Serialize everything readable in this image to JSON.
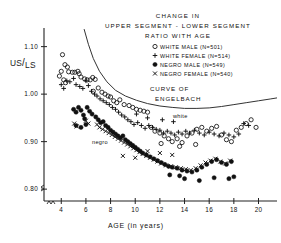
{
  "chart_data": {
    "type": "scatter",
    "title": "CHANGE IN UPPER SEGMENT - LOWER SEGMENT RATIO WITH AGE",
    "title_lines": [
      "CHANGE IN",
      "UPPER SEGMENT - LOWER SEGMENT",
      "RATIO WITH AGE"
    ],
    "xlabel": "AGE (in years)",
    "ylabel": "US/LS",
    "ylabel_parts": {
      "numerator": "US",
      "slash": "/",
      "denominator": "LS"
    },
    "xlim": [
      2.6,
      21.5
    ],
    "ylim": [
      0.775,
      1.135
    ],
    "xticks": [
      4,
      6,
      8,
      10,
      12,
      14,
      16,
      18,
      20
    ],
    "xtick_labels": [
      "4",
      "6",
      "8",
      "10",
      "12",
      "14",
      "16",
      "18",
      "20"
    ],
    "yticks": [
      0.8,
      0.9,
      1.0,
      1.1
    ],
    "ytick_labels": [
      "0.80",
      "0.90",
      "1.00",
      "1.10"
    ],
    "grid": false,
    "axis_break_x": true,
    "axis_break_y": true,
    "legend_position": "upper right",
    "legend": [
      {
        "symbol": "open-circle",
        "label": "WHITE MALE (N=501)",
        "series": "white_male",
        "n": 501
      },
      {
        "symbol": "plus",
        "label": "WHITE FEMALE (N=514)",
        "series": "white_female",
        "n": 514
      },
      {
        "symbol": "filled-circle",
        "label": "NEGRO MALE (N=549)",
        "series": "negro_male",
        "n": 549
      },
      {
        "symbol": "x-cross",
        "label": "NEGRO FEMALE (N=540)",
        "series": "negro_female",
        "n": 540
      }
    ],
    "annotations": [
      {
        "text": "CURVE OF",
        "x": 11.2,
        "y": 0.992
      },
      {
        "text": "ENGELBACH",
        "x": 11.6,
        "y": 0.972
      },
      {
        "text": "white",
        "x": 12.9,
        "y": 0.942
      },
      {
        "text": "negro",
        "x": 8.1,
        "y": 0.888
      }
    ],
    "curve": {
      "name": "Curve of Engelbach",
      "points": [
        [
          5.85,
          1.137
        ],
        [
          6.2,
          1.105
        ],
        [
          6.6,
          1.075
        ],
        [
          7.1,
          1.048
        ],
        [
          7.7,
          1.026
        ],
        [
          8.4,
          1.008
        ],
        [
          9.2,
          0.996
        ],
        [
          10.1,
          0.987
        ],
        [
          11.0,
          0.98
        ],
        [
          12.0,
          0.975
        ],
        [
          13.0,
          0.972
        ],
        [
          14.0,
          0.97
        ],
        [
          15.0,
          0.97
        ],
        [
          16.0,
          0.971
        ],
        [
          17.0,
          0.974
        ],
        [
          18.0,
          0.978
        ],
        [
          19.0,
          0.982
        ],
        [
          20.0,
          0.986
        ],
        [
          21.0,
          0.99
        ],
        [
          21.5,
          0.992
        ]
      ]
    },
    "series": [
      {
        "name": "WHITE MALE",
        "symbol": "open-circle",
        "points": [
          [
            4.1,
            1.083
          ],
          [
            4.3,
            1.062
          ],
          [
            4.5,
            1.057
          ],
          [
            4.0,
            1.048
          ],
          [
            3.85,
            1.038
          ],
          [
            4.6,
            1.047
          ],
          [
            4.9,
            1.046
          ],
          [
            5.1,
            1.046
          ],
          [
            5.35,
            1.048
          ],
          [
            5.45,
            1.043
          ],
          [
            4.2,
            1.03
          ],
          [
            4.35,
            1.024
          ],
          [
            5.6,
            1.036
          ],
          [
            5.9,
            1.032
          ],
          [
            6.1,
            1.03
          ],
          [
            6.35,
            1.03
          ],
          [
            6.55,
            1.035
          ],
          [
            6.75,
            1.031
          ],
          [
            7.0,
            1.013
          ],
          [
            6.6,
            1.006
          ],
          [
            7.3,
            1.004
          ],
          [
            7.55,
            1.0
          ],
          [
            7.8,
            0.996
          ],
          [
            8.0,
            0.994
          ],
          [
            8.25,
            0.986
          ],
          [
            8.5,
            0.982
          ],
          [
            8.75,
            0.988
          ],
          [
            9.1,
            0.978
          ],
          [
            9.5,
            0.976
          ],
          [
            9.8,
            0.972
          ],
          [
            10.1,
            0.968
          ],
          [
            10.4,
            0.966
          ],
          [
            10.7,
            0.964
          ],
          [
            11.0,
            0.962
          ],
          [
            11.3,
            0.93
          ],
          [
            11.6,
            0.922
          ],
          [
            12.0,
            0.918
          ],
          [
            12.35,
            0.912
          ],
          [
            12.7,
            0.906
          ],
          [
            13.0,
            0.9
          ],
          [
            13.4,
            0.906
          ],
          [
            13.8,
            0.898
          ],
          [
            14.2,
            0.912
          ],
          [
            14.6,
            0.918
          ],
          [
            15.0,
            0.926
          ],
          [
            15.4,
            0.93
          ],
          [
            15.8,
            0.922
          ],
          [
            16.2,
            0.928
          ],
          [
            16.6,
            0.932
          ],
          [
            17.0,
            0.914
          ],
          [
            17.4,
            0.904
          ],
          [
            17.8,
            0.9
          ],
          [
            18.2,
            0.924
          ],
          [
            18.6,
            0.93
          ],
          [
            19.0,
            0.938
          ],
          [
            19.4,
            0.946
          ],
          [
            19.8,
            0.93
          ],
          [
            12.1,
            0.896
          ],
          [
            13.6,
            0.89
          ],
          [
            14.9,
            0.894
          ]
        ]
      },
      {
        "name": "WHITE FEMALE",
        "symbol": "plus",
        "points": [
          [
            4.0,
            1.02
          ],
          [
            4.2,
            1.012
          ],
          [
            4.45,
            1.028
          ],
          [
            4.7,
            1.026
          ],
          [
            5.0,
            1.033
          ],
          [
            5.2,
            1.02
          ],
          [
            5.5,
            1.016
          ],
          [
            5.75,
            1.012
          ],
          [
            6.0,
            1.028
          ],
          [
            6.2,
            1.018
          ],
          [
            6.45,
            1.006
          ],
          [
            6.7,
            1.0
          ],
          [
            6.9,
            0.996
          ],
          [
            7.15,
            0.99
          ],
          [
            7.4,
            0.986
          ],
          [
            7.65,
            0.982
          ],
          [
            7.9,
            0.978
          ],
          [
            8.15,
            0.972
          ],
          [
            8.4,
            0.968
          ],
          [
            8.65,
            0.962
          ],
          [
            8.9,
            0.956
          ],
          [
            9.15,
            0.952
          ],
          [
            9.4,
            0.946
          ],
          [
            9.65,
            0.942
          ],
          [
            9.9,
            0.936
          ],
          [
            10.2,
            0.94
          ],
          [
            10.5,
            0.934
          ],
          [
            10.8,
            0.928
          ],
          [
            11.1,
            0.934
          ],
          [
            11.4,
            0.93
          ],
          [
            11.7,
            0.926
          ],
          [
            12.0,
            0.924
          ],
          [
            12.3,
            0.918
          ],
          [
            12.6,
            0.922
          ],
          [
            12.9,
            0.918
          ],
          [
            13.2,
            0.914
          ],
          [
            13.5,
            0.92
          ],
          [
            13.8,
            0.916
          ],
          [
            14.1,
            0.922
          ],
          [
            14.4,
            0.918
          ],
          [
            14.8,
            0.924
          ],
          [
            15.2,
            0.918
          ],
          [
            15.6,
            0.914
          ],
          [
            16.0,
            0.92
          ],
          [
            16.4,
            0.916
          ],
          [
            16.8,
            0.912
          ],
          [
            17.2,
            0.918
          ],
          [
            17.6,
            0.914
          ],
          [
            18.0,
            0.91
          ],
          [
            18.4,
            0.916
          ],
          [
            18.8,
            0.938
          ],
          [
            19.2,
            0.934
          ],
          [
            10.1,
            0.958
          ],
          [
            11.0,
            0.95
          ],
          [
            12.2,
            0.946
          ],
          [
            13.1,
            0.942
          ]
        ]
      },
      {
        "name": "NEGRO MALE",
        "symbol": "filled-circle",
        "points": [
          [
            5.0,
            0.968
          ],
          [
            5.2,
            0.962
          ],
          [
            5.4,
            0.972
          ],
          [
            5.6,
            0.966
          ],
          [
            5.8,
            0.956
          ],
          [
            5.9,
            0.948
          ],
          [
            6.1,
            0.972
          ],
          [
            6.3,
            0.964
          ],
          [
            6.5,
            0.958
          ],
          [
            6.0,
            0.936
          ],
          [
            5.2,
            0.934
          ],
          [
            5.6,
            0.93
          ],
          [
            6.8,
            0.952
          ],
          [
            7.0,
            0.946
          ],
          [
            7.2,
            0.94
          ],
          [
            7.4,
            0.942
          ],
          [
            7.6,
            0.934
          ],
          [
            7.8,
            0.93
          ],
          [
            8.0,
            0.924
          ],
          [
            8.2,
            0.92
          ],
          [
            8.4,
            0.916
          ],
          [
            8.6,
            0.912
          ],
          [
            8.8,
            0.908
          ],
          [
            9.0,
            0.912
          ],
          [
            9.2,
            0.904
          ],
          [
            9.4,
            0.9
          ],
          [
            9.6,
            0.896
          ],
          [
            9.8,
            0.892
          ],
          [
            10.0,
            0.888
          ],
          [
            10.2,
            0.884
          ],
          [
            10.4,
            0.88
          ],
          [
            10.6,
            0.876
          ],
          [
            10.9,
            0.872
          ],
          [
            11.2,
            0.868
          ],
          [
            11.5,
            0.864
          ],
          [
            11.8,
            0.86
          ],
          [
            12.1,
            0.856
          ],
          [
            12.4,
            0.852
          ],
          [
            12.7,
            0.848
          ],
          [
            13.0,
            0.846
          ],
          [
            13.4,
            0.844
          ],
          [
            13.8,
            0.84
          ],
          [
            14.2,
            0.838
          ],
          [
            14.6,
            0.836
          ],
          [
            15.0,
            0.84
          ],
          [
            15.4,
            0.846
          ],
          [
            15.8,
            0.852
          ],
          [
            16.2,
            0.858
          ],
          [
            16.6,
            0.862
          ],
          [
            17.0,
            0.856
          ],
          [
            17.4,
            0.852
          ],
          [
            17.8,
            0.858
          ],
          [
            14.0,
            0.822
          ],
          [
            15.2,
            0.818
          ],
          [
            16.4,
            0.824
          ],
          [
            17.6,
            0.822
          ],
          [
            12.8,
            0.83
          ],
          [
            13.6,
            0.828
          ],
          [
            18.0,
            0.826
          ]
        ]
      },
      {
        "name": "NEGRO FEMALE",
        "symbol": "x-cross",
        "points": [
          [
            5.05,
            0.938
          ],
          [
            5.25,
            0.932
          ],
          [
            6.0,
            0.944
          ],
          [
            6.2,
            0.938
          ],
          [
            6.9,
            0.936
          ],
          [
            7.1,
            0.93
          ],
          [
            7.35,
            0.926
          ],
          [
            7.6,
            0.922
          ],
          [
            7.85,
            0.918
          ],
          [
            8.1,
            0.914
          ],
          [
            8.35,
            0.91
          ],
          [
            8.6,
            0.906
          ],
          [
            8.85,
            0.902
          ],
          [
            9.1,
            0.898
          ],
          [
            9.35,
            0.894
          ],
          [
            9.6,
            0.89
          ],
          [
            9.85,
            0.886
          ],
          [
            10.1,
            0.882
          ],
          [
            10.35,
            0.878
          ],
          [
            10.6,
            0.874
          ],
          [
            10.9,
            0.87
          ],
          [
            11.2,
            0.866
          ],
          [
            11.5,
            0.862
          ],
          [
            11.8,
            0.858
          ],
          [
            12.1,
            0.854
          ],
          [
            12.5,
            0.85
          ],
          [
            12.9,
            0.848
          ],
          [
            13.3,
            0.846
          ],
          [
            13.7,
            0.844
          ],
          [
            14.1,
            0.842
          ],
          [
            14.5,
            0.84
          ],
          [
            14.9,
            0.844
          ],
          [
            15.3,
            0.85
          ],
          [
            15.7,
            0.856
          ],
          [
            16.1,
            0.86
          ],
          [
            16.5,
            0.864
          ],
          [
            16.9,
            0.858
          ],
          [
            17.3,
            0.854
          ],
          [
            17.7,
            0.86
          ],
          [
            9.0,
            0.87
          ],
          [
            10.0,
            0.866
          ],
          [
            11.0,
            0.88
          ],
          [
            12.0,
            0.876
          ],
          [
            13.0,
            0.872
          ]
        ]
      }
    ]
  }
}
